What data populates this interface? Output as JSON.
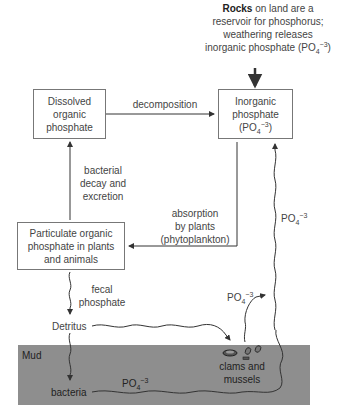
{
  "source": {
    "bold": "Rocks",
    "line1_rest": " on land are a",
    "line2": "reservoir for phosphorus;",
    "line3": "weathering releases",
    "line4_pre": "inorganic phosphate (PO",
    "line4_sub": "4",
    "line4_sup": "−3",
    "line4_post": ")"
  },
  "boxes": {
    "dissolved": {
      "line1": "Dissolved",
      "line2": "organic",
      "line3": "phosphate"
    },
    "inorganic": {
      "line1": "Inorganic",
      "line2": "phosphate",
      "line3_pre": "(PO",
      "line3_sub": "4",
      "line3_sup": "−3",
      "line3_post": ")"
    },
    "particulate": {
      "line1": "Particulate organic",
      "line2": "phosphate in plants",
      "line3": "and animals"
    }
  },
  "labels": {
    "decomposition": "decomposition",
    "bacterial": {
      "line1": "bacterial",
      "line2": "decay and",
      "line3": "excretion"
    },
    "absorption": {
      "line1": "absorption",
      "line2": "by plants",
      "line3": "(phytoplankton)"
    },
    "fecal": {
      "line1": "fecal",
      "line2": "phosphate"
    },
    "detritus": "Detritus",
    "mud": "Mud",
    "bacteria": "bacteria",
    "clams": {
      "line1": "clams and",
      "line2": "mussels"
    },
    "po4_base": "PO",
    "po4_sub": "4",
    "po4_sup": "−3"
  },
  "colors": {
    "mud": "#8e8e8e",
    "line": "#333333",
    "box_border": "#777777"
  }
}
